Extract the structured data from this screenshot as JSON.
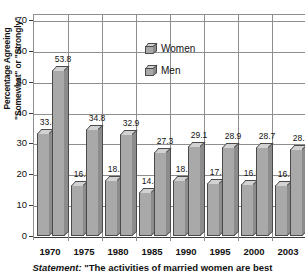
{
  "chart_data": {
    "type": "bar",
    "title": "",
    "xlabel": "",
    "ylabel_line1": "Percentage Agreeing",
    "ylabel_line2": "\"Somewhat\" or \"Strongly\"",
    "categories": [
      "1970",
      "1975",
      "1980",
      "1985",
      "1990",
      "1995",
      "2000",
      "2003"
    ],
    "series": [
      {
        "name": "Women",
        "values": [
          33.3,
          16.6,
          18.2,
          14.4,
          18.1,
          17.3,
          16.8,
          16.5
        ]
      },
      {
        "name": "Men",
        "values": [
          53.8,
          34.8,
          32.9,
          27.3,
          29.1,
          28.9,
          28.7,
          28.1
        ]
      }
    ],
    "ylim": [
      0,
      70
    ],
    "ytick_step": 10,
    "yticks": [
      "70",
      "60",
      "50",
      "40",
      "30",
      "20",
      "10",
      "0"
    ],
    "grid": true,
    "legend_position": "inside-top-center",
    "bar_style": "3d",
    "colors": {
      "bar_face": "#a9a9a9",
      "bar_top": "#d2d2d2",
      "bar_side": "#8c8c8c",
      "bar_outline": "#4a4a4a",
      "gridline": "#8e8e8e",
      "text": "#121212",
      "background": "#ffffff"
    }
  },
  "legend": {
    "items": [
      {
        "label": "Women"
      },
      {
        "label": "Men"
      }
    ]
  },
  "caption": {
    "prefix": "Statement:",
    "text": "\"The activities of married women are best"
  }
}
